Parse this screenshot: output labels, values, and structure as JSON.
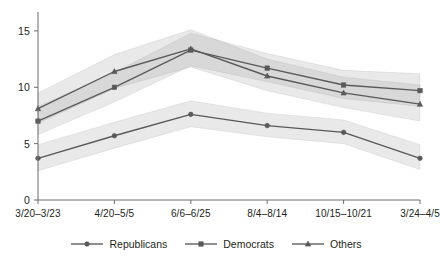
{
  "chart_data": {
    "type": "line",
    "title": "",
    "xlabel": "",
    "ylabel": "",
    "categories": [
      "3/20–3/23",
      "4/20–5/5",
      "6/6–6/25",
      "8/4–8/14",
      "10/15–10/21",
      "3/24–4/5"
    ],
    "ylim": [
      0,
      16.5
    ],
    "yticks": [
      0,
      5,
      10,
      15
    ],
    "ytick_labels": [
      "0",
      "5",
      "10",
      "15"
    ],
    "grid": false,
    "legend_position": "bottom",
    "series": [
      {
        "name": "Republicans",
        "marker": "circle",
        "color": "#595959",
        "values": [
          3.7,
          5.7,
          7.6,
          6.6,
          6.0,
          3.7
        ],
        "band_low": [
          2.6,
          4.6,
          6.5,
          5.6,
          5.0,
          2.7
        ],
        "band_high": [
          4.9,
          6.9,
          8.8,
          7.7,
          7.1,
          4.9
        ]
      },
      {
        "name": "Democrats",
        "marker": "square",
        "color": "#595959",
        "values": [
          7.0,
          10.0,
          13.3,
          11.7,
          10.2,
          9.7
        ],
        "band_low": [
          5.8,
          8.7,
          11.9,
          10.5,
          9.0,
          8.3
        ],
        "band_high": [
          8.3,
          11.3,
          14.8,
          13.0,
          11.5,
          11.2
        ]
      },
      {
        "name": "Others",
        "marker": "triangle",
        "color": "#595959",
        "values": [
          8.1,
          11.4,
          13.4,
          11.0,
          9.5,
          8.5
        ],
        "band_low": [
          6.8,
          9.9,
          11.8,
          9.7,
          8.2,
          7.0
        ],
        "band_high": [
          9.5,
          12.9,
          15.1,
          12.5,
          10.9,
          10.2
        ]
      }
    ]
  },
  "legend": {
    "items": [
      {
        "label": "Republicans",
        "marker": "circle"
      },
      {
        "label": "Democrats",
        "marker": "square"
      },
      {
        "label": "Others",
        "marker": "triangle"
      }
    ]
  },
  "colors": {
    "line": "#595959",
    "band": "#9a9a9a",
    "axis": "#6d6d6d",
    "text": "#231f20",
    "background": "#ffffff"
  }
}
